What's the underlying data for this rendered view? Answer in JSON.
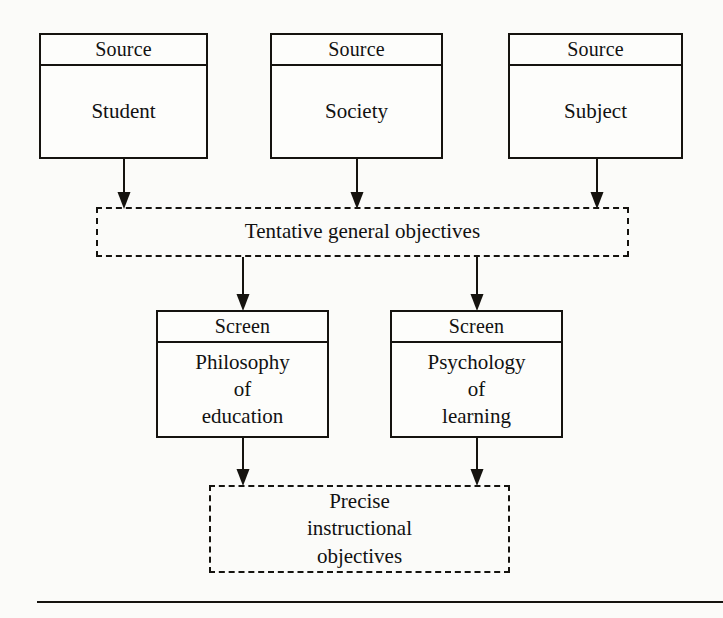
{
  "figure": {
    "type": "flowchart",
    "title": "",
    "background_color": "#fbfbf9",
    "line_color": "#15130f"
  },
  "sources": [
    {
      "header": "Source",
      "body": "Student"
    },
    {
      "header": "Source",
      "body": "Society"
    },
    {
      "header": "Source",
      "body": "Subject"
    }
  ],
  "tentative": {
    "label": "Tentative general objectives",
    "border_style": "dashed"
  },
  "screens": [
    {
      "header": "Screen",
      "body_line1": "Philosophy",
      "body_line2": "of",
      "body_line3": "education"
    },
    {
      "header": "Screen",
      "body_line1": "Psychology",
      "body_line2": "of",
      "body_line3": "learning"
    }
  ],
  "precise": {
    "line1": "Precise",
    "line2": "instructional",
    "line3": "objectives",
    "border_style": "dashed"
  },
  "connectors": [
    {
      "name": "student-to-tentative",
      "glyph": "arrow-down-icon"
    },
    {
      "name": "society-to-tentative",
      "glyph": "arrow-down-icon"
    },
    {
      "name": "subject-to-tentative",
      "glyph": "arrow-down-icon"
    },
    {
      "name": "tentative-to-philosophy",
      "glyph": "arrow-down-icon"
    },
    {
      "name": "tentative-to-psychology",
      "glyph": "arrow-down-icon"
    },
    {
      "name": "philosophy-to-precise",
      "glyph": "arrow-down-icon"
    },
    {
      "name": "psychology-to-precise",
      "glyph": "arrow-down-icon"
    }
  ]
}
